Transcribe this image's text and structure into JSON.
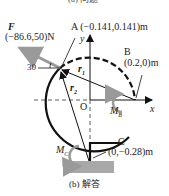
{
  "captions": {
    "top": "(a) 问题",
    "bottom": "(b) 解答"
  },
  "force": {
    "symbol": "F",
    "value": "(−86.6,50)N",
    "angle": "30"
  },
  "points": {
    "A": {
      "name": "A",
      "coords": "(−0.141,0.141)m"
    },
    "B": {
      "name": "B",
      "coords": "(0.2,0)m"
    },
    "C": {
      "name": "C",
      "coords": "(0,−0.28)m"
    },
    "O": {
      "name": "O"
    }
  },
  "vectors": {
    "r1": "r",
    "r1_sub": "1",
    "r2": "r",
    "r2_sub": "2"
  },
  "axes": {
    "x": "x",
    "y": "y"
  },
  "moments": {
    "MB": "M",
    "MB_sub": "B",
    "MC": "M",
    "MC_sub": "C"
  },
  "colors": {
    "structure": "#111111",
    "force_arrow": "#9a9a9a",
    "support": "#a8a8a8",
    "dashed_arc": "#888888"
  }
}
